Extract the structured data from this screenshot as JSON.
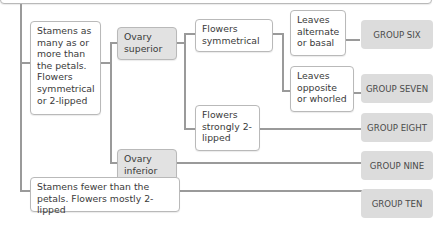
{
  "diagram": {
    "type": "dichotomous-key",
    "nodes": {
      "stamens_many": "Stamens as many as or more than the petals. Flowers symmetrical or 2-lipped",
      "stamens_fewer": "Stamens fewer than the petals. Flowers mostly 2-lipped",
      "ovary_superior": "Ovary superior",
      "ovary_inferior": "Ovary inferior",
      "flowers_symmetrical": "Flowers symmetrical",
      "flowers_2lipped": "Flowers strongly 2-lipped",
      "leaves_alternate": "Leaves alternate or basal",
      "leaves_opposite": "Leaves opposite or whorled"
    },
    "groups": {
      "six": "GROUP SIX",
      "seven": "GROUP SEVEN",
      "eight": "GROUP EIGHT",
      "nine": "GROUP NINE",
      "ten": "GROUP TEN"
    },
    "colors": {
      "line": "#9a9a9a",
      "box_border": "#b9b9b9",
      "ovary_fill": "#e2e2e2",
      "group_fill": "#dcdcdc"
    }
  }
}
